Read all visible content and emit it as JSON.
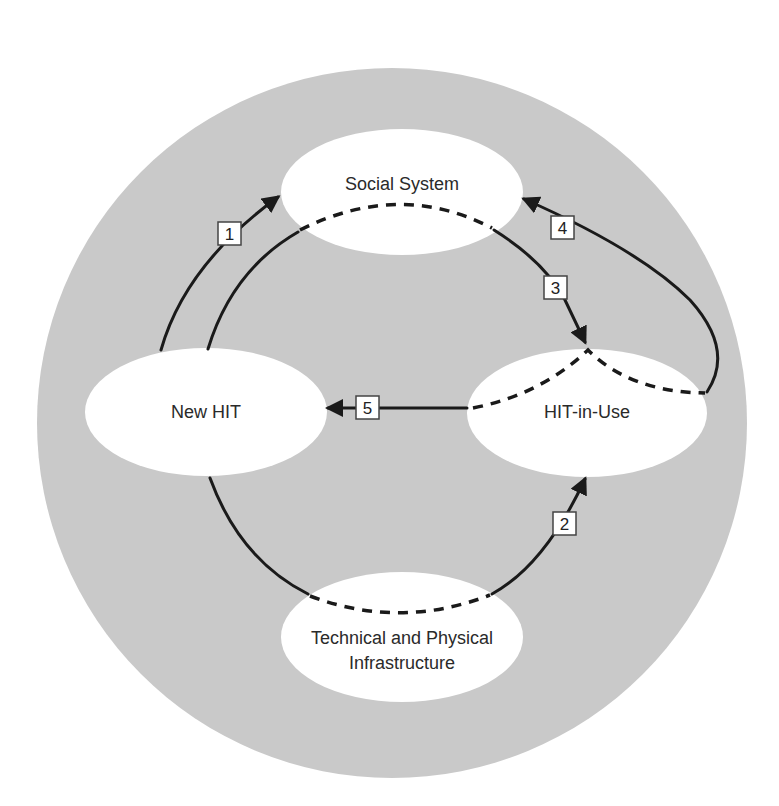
{
  "diagram": {
    "colors": {
      "background": "#ffffff",
      "outer_circle": "#c9c9c9",
      "node_fill": "#ffffff",
      "line": "#1a1a1a"
    },
    "nodes": {
      "social_system": {
        "label": "Social System"
      },
      "new_hit": {
        "label": "New HIT"
      },
      "hit_in_use": {
        "label": "HIT-in-Use"
      },
      "infrastructure": {
        "line1": "Technical and Physical",
        "line2": "Infrastructure"
      }
    },
    "arrows": [
      {
        "id": "1",
        "label": "1",
        "from": "New HIT",
        "to": "Social System"
      },
      {
        "id": "2",
        "label": "2",
        "from": "Technical and Physical Infrastructure",
        "to": "HIT-in-Use"
      },
      {
        "id": "3",
        "label": "3",
        "from": "Social System",
        "to": "HIT-in-Use"
      },
      {
        "id": "4",
        "label": "4",
        "from": "HIT-in-Use",
        "to": "Social System"
      },
      {
        "id": "5",
        "label": "5",
        "from": "HIT-in-Use",
        "to": "New HIT"
      }
    ]
  }
}
